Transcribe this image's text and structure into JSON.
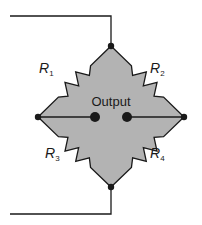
{
  "diagram": {
    "output_label": "Output",
    "colors": {
      "fill": "#b3b3b3",
      "stroke": "#1a1a1a",
      "background": "#ffffff"
    },
    "nodes": {
      "top": [
        111,
        46
      ],
      "left": [
        38,
        117
      ],
      "right": [
        184,
        117
      ],
      "bottom": [
        111,
        187
      ]
    },
    "output_terminals": [
      [
        95,
        117
      ],
      [
        127,
        117
      ]
    ],
    "wires": {
      "top_lead": [
        [
          10,
          16
        ],
        [
          111,
          16
        ],
        [
          111,
          46
        ]
      ],
      "bottom_lead": [
        [
          111,
          187
        ],
        [
          111,
          214
        ],
        [
          10,
          214
        ]
      ]
    },
    "resistors": [
      {
        "name": "R",
        "sub": "1",
        "edge": [
          "top",
          "left"
        ],
        "label_pos": [
          49,
          79
        ]
      },
      {
        "name": "R",
        "sub": "2",
        "edge": [
          "top",
          "right"
        ],
        "label_pos": [
          160,
          79
        ]
      },
      {
        "name": "R",
        "sub": "3",
        "edge": [
          "bottom",
          "left"
        ],
        "label_pos": [
          55,
          164
        ]
      },
      {
        "name": "R",
        "sub": "4",
        "edge": [
          "bottom",
          "right"
        ],
        "label_pos": [
          160,
          164
        ]
      }
    ]
  }
}
